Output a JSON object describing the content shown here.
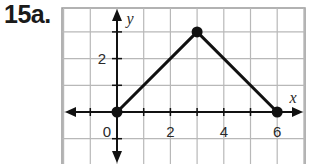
{
  "problem_label": "15a.",
  "chart_data": {
    "type": "line",
    "title": "",
    "xlabel": "x",
    "ylabel": "y",
    "xlim": [
      -2,
      7
    ],
    "ylim": [
      -2,
      4
    ],
    "grid": true,
    "x_ticks": [
      {
        "value": 0,
        "label": "0"
      },
      {
        "value": 2,
        "label": "2"
      },
      {
        "value": 4,
        "label": "4"
      },
      {
        "value": 6,
        "label": "6"
      }
    ],
    "y_ticks": [
      {
        "value": 2,
        "label": "2"
      }
    ],
    "series": [
      {
        "name": "triangle-path",
        "points": [
          {
            "x": 0,
            "y": 0
          },
          {
            "x": 3,
            "y": 3
          },
          {
            "x": 6,
            "y": 0
          }
        ],
        "markers": true
      }
    ]
  },
  "colors": {
    "grid": "#b8b8b8",
    "axis": "#111111",
    "line": "#111111",
    "border": "#999999"
  }
}
